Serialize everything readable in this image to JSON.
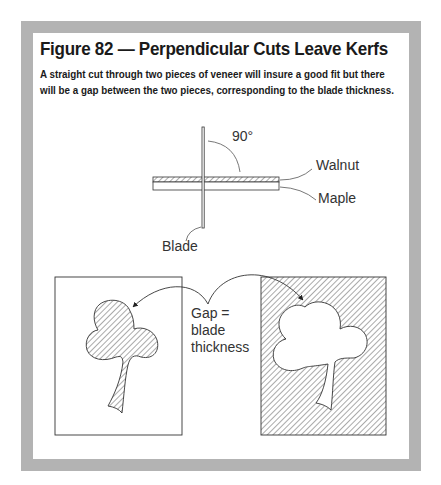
{
  "figure": {
    "title": "Figure 82 — Perpendicular Cuts Leave Kerfs",
    "caption_lines": [
      "A straight cut through two pieces of veneer will insure a good fit but there",
      "will be a gap between the two pieces, corresponding to the blade thickness."
    ]
  },
  "diagram": {
    "angle_label": "90°",
    "top_layer_label": "Walnut",
    "bottom_layer_label": "Maple",
    "blade_label": "Blade",
    "gap_label_lines": [
      "Gap =",
      "blade",
      "thickness"
    ]
  },
  "colors": {
    "frame": "#b3b3b3",
    "panel": "#ffffff",
    "ink": "#333333",
    "text": "#1a1a1a"
  }
}
